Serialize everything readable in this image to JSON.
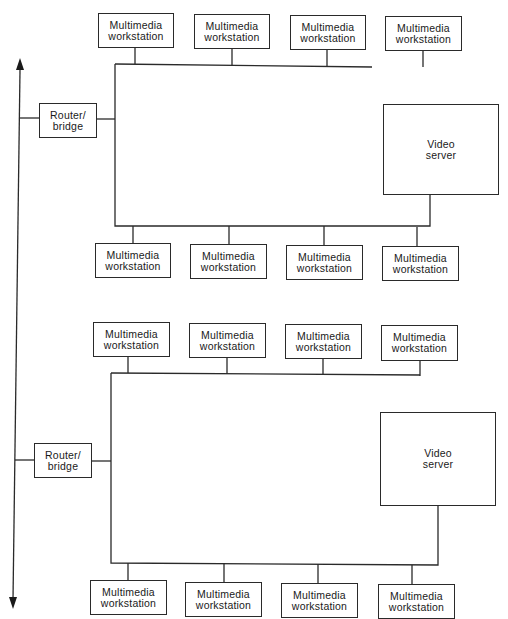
{
  "diagram": {
    "type": "network-topology",
    "backbone": {
      "label": "",
      "arrow_up": true,
      "arrow_down": true,
      "color": "#1a1a1a"
    },
    "segments": [
      {
        "router": {
          "label": "Router/\nbridge"
        },
        "server": {
          "label": "Video\nserver"
        },
        "top_workstations": [
          {
            "label": "Multimedia\nworkstation"
          },
          {
            "label": "Multimedia\nworkstation"
          },
          {
            "label": "Multimedia\nworkstation"
          },
          {
            "label": "Multimedia\nworkstation"
          }
        ],
        "bottom_workstations": [
          {
            "label": "Multimedia\nworkstation"
          },
          {
            "label": "Multimedia\nworkstation"
          },
          {
            "label": "Multimedia\nworkstation"
          },
          {
            "label": "Multimedia\nworkstation"
          }
        ]
      },
      {
        "router": {
          "label": "Router/\nbridge"
        },
        "server": {
          "label": "Video\nserver"
        },
        "top_workstations": [
          {
            "label": "Multimedia\nworkstation"
          },
          {
            "label": "Multimedia\nworkstation"
          },
          {
            "label": "Multimedia\nworkstation"
          },
          {
            "label": "Multimedia\nworkstation"
          }
        ],
        "bottom_workstations": [
          {
            "label": "Multimedia\nworkstation"
          },
          {
            "label": "Multimedia\nworkstation"
          },
          {
            "label": "Multimedia\nworkstation"
          },
          {
            "label": "Multimedia\nworkstation"
          }
        ]
      }
    ],
    "colors": {
      "line": "#2a2a2a",
      "background": "#ffffff"
    }
  }
}
